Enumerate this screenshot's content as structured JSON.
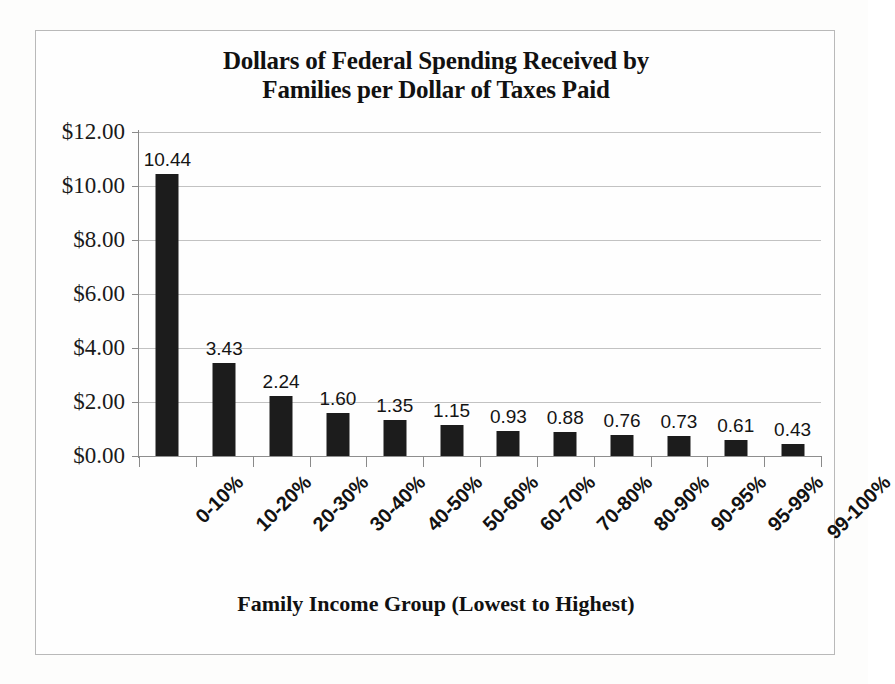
{
  "chart_data": {
    "type": "bar",
    "title": "Dollars of Federal Spending Received by Families per Dollar of Taxes Paid",
    "title_lines": [
      "Dollars of Federal Spending Received by",
      "Families per Dollar of Taxes Paid"
    ],
    "xlabel": "Family Income Group (Lowest to Highest)",
    "ylabel": "",
    "categories": [
      "0-10%",
      "10-20%",
      "20-30%",
      "30-40%",
      "40-50%",
      "50-60%",
      "60-70%",
      "70-80%",
      "80-90%",
      "90-95%",
      "95-99%",
      "99-100%"
    ],
    "values": [
      10.44,
      3.43,
      2.24,
      1.6,
      1.35,
      1.15,
      0.93,
      0.88,
      0.76,
      0.73,
      0.61,
      0.43
    ],
    "data_labels": [
      "10.44",
      "3.43",
      "2.24",
      "1.60",
      "1.35",
      "1.15",
      "0.93",
      "0.88",
      "0.76",
      "0.73",
      "0.61",
      "0.43"
    ],
    "ylim": [
      0,
      12
    ],
    "ytick_values": [
      0,
      2,
      4,
      6,
      8,
      10,
      12
    ],
    "ytick_labels": [
      "$0.00",
      "$2.00",
      "$4.00",
      "$6.00",
      "$8.00",
      "$10.00",
      "$12.00"
    ],
    "grid": true,
    "legend": false,
    "bar_color": "#1c1c1c",
    "gridline_color": "#c2c2c2",
    "axis_color": "#8a8a8a",
    "background_color": "#fefefe"
  }
}
